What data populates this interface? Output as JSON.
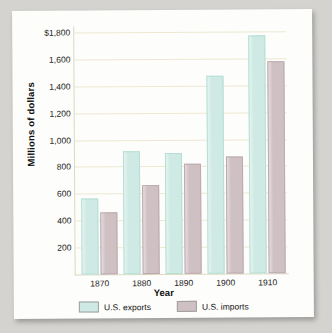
{
  "chart_data": {
    "type": "bar",
    "title": "",
    "xlabel": "Year",
    "ylabel": "Millions of dollars",
    "categories": [
      "1870",
      "1880",
      "1890",
      "1900",
      "1910"
    ],
    "series": [
      {
        "name": "U.S. exports",
        "color": "#cfeae4",
        "values": [
          550,
          900,
          885,
          1455,
          1755
        ]
      },
      {
        "name": "U.S. imports",
        "color": "#cfc0c4",
        "values": [
          450,
          650,
          800,
          855,
          1560
        ]
      }
    ],
    "ylim": [
      0,
      1800
    ],
    "ytick_values": [
      1800,
      1600,
      1400,
      1200,
      1000,
      800,
      600,
      400,
      200
    ],
    "ytick_labels": [
      "$1,800",
      "1,600",
      "1,400",
      "1,200",
      "1,000",
      "800",
      "600",
      "400",
      "200"
    ],
    "grid": true,
    "legend_position": "bottom"
  }
}
